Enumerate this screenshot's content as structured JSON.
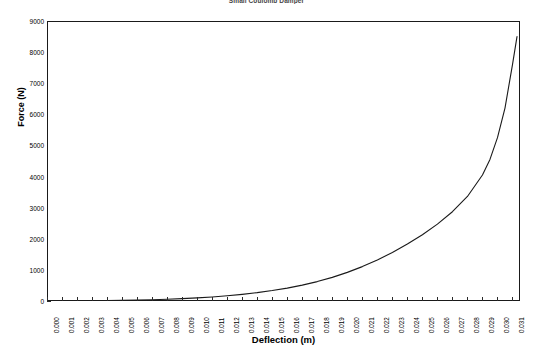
{
  "chart_data": {
    "type": "line",
    "title": "Small Coulomb Damper",
    "xlabel": "Deflection (m)",
    "ylabel": "Force (N)",
    "xlim": [
      0.0,
      0.0315
    ],
    "ylim": [
      0,
      9000
    ],
    "grid": false,
    "legend": "none",
    "y_ticks": [
      0,
      1000,
      2000,
      3000,
      4000,
      5000,
      6000,
      7000,
      8000,
      9000
    ],
    "y_tick_labels": [
      "0",
      "1000",
      "2000",
      "3000",
      "4000",
      "5000",
      "6000",
      "7000",
      "8000",
      "9000"
    ],
    "x_ticks": [
      0.0,
      0.001,
      0.002,
      0.003,
      0.004,
      0.005,
      0.006,
      0.007,
      0.008,
      0.009,
      0.01,
      0.011,
      0.012,
      0.013,
      0.014,
      0.015,
      0.016,
      0.017,
      0.018,
      0.019,
      0.02,
      0.021,
      0.022,
      0.023,
      0.024,
      0.025,
      0.026,
      0.027,
      0.028,
      0.029,
      0.03,
      0.031
    ],
    "x_tick_labels": [
      "0.000",
      "0.001",
      "0.002",
      "0.003",
      "0.004",
      "0.005",
      "0.006",
      "0.007",
      "0.008",
      "0.009",
      "0.010",
      "0.011",
      "0.012",
      "0.013",
      "0.014",
      "0.015",
      "0.016",
      "0.017",
      "0.018",
      "0.019",
      "0.020",
      "0.021",
      "0.022",
      "0.023",
      "0.024",
      "0.025",
      "0.026",
      "0.027",
      "0.028",
      "0.029",
      "0.030",
      "0.031"
    ],
    "series": [
      {
        "name": "Force",
        "color": "#1a1a1a",
        "x": [
          0.0,
          0.001,
          0.002,
          0.003,
          0.004,
          0.005,
          0.006,
          0.007,
          0.008,
          0.009,
          0.01,
          0.011,
          0.012,
          0.013,
          0.014,
          0.015,
          0.016,
          0.017,
          0.018,
          0.019,
          0.02,
          0.021,
          0.022,
          0.023,
          0.024,
          0.025,
          0.026,
          0.027,
          0.028,
          0.029,
          0.0295,
          0.03,
          0.0305,
          0.031,
          0.0313
        ],
        "values": [
          0,
          2,
          5,
          9,
          14,
          21,
          30,
          42,
          57,
          76,
          100,
          130,
          167,
          213,
          268,
          335,
          415,
          510,
          624,
          760,
          920,
          1105,
          1320,
          1560,
          1830,
          2130,
          2470,
          2870,
          3360,
          4050,
          4550,
          5250,
          6200,
          7600,
          8500
        ]
      }
    ]
  }
}
